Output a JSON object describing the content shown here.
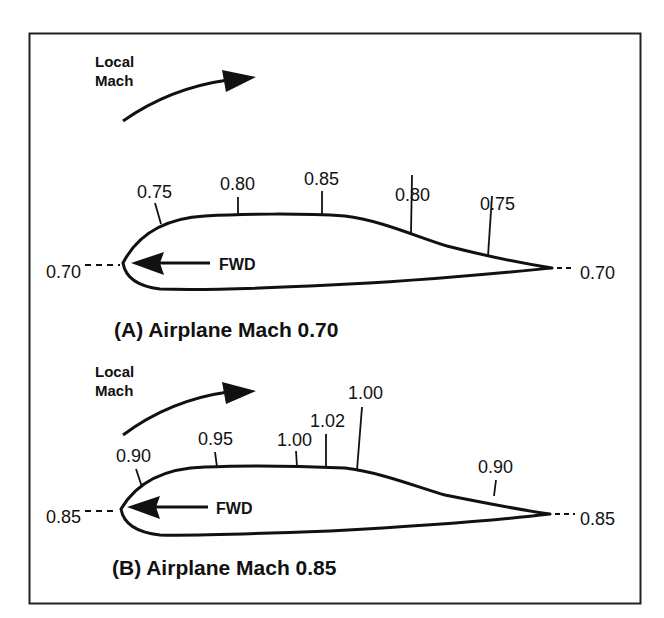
{
  "colors": {
    "ink": "#111111",
    "background": "#ffffff",
    "frame": "#222222"
  },
  "panels": [
    {
      "id": "A",
      "caption": "(A) Airplane Mach 0.70",
      "local_mach_label_line1": "Local",
      "local_mach_label_line2": "Mach",
      "fwd_label": "FWD",
      "leading_edge_value": "0.70",
      "trailing_edge_value": "0.70",
      "surface_values": [
        "0.75",
        "0.80",
        "0.85",
        "0.80",
        "0.75"
      ]
    },
    {
      "id": "B",
      "caption": "(B) Airplane Mach 0.85",
      "local_mach_label_line1": "Local",
      "local_mach_label_line2": "Mach",
      "fwd_label": "FWD",
      "leading_edge_value": "0.85",
      "trailing_edge_value": "0.85",
      "surface_values": [
        "0.90",
        "0.95",
        "1.00",
        "1.02",
        "1.00",
        "0.90"
      ]
    }
  ]
}
